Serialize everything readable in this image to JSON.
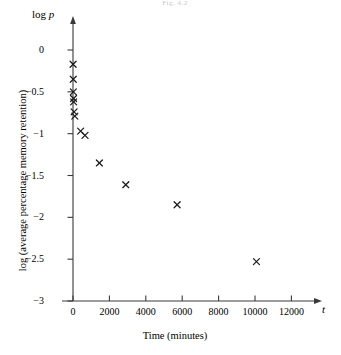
{
  "figure": {
    "caption": "Fig. 4.2"
  },
  "chart_data": {
    "type": "scatter",
    "title": "",
    "xlabel": "Time (minutes)",
    "ylabel": "log (average percentage memory retention)",
    "x_variable_symbol": "t",
    "y_variable_symbol": "log p",
    "xlim": [
      -600,
      13600
    ],
    "ylim": [
      -3,
      0.25
    ],
    "xticks": [
      0,
      2000,
      4000,
      6000,
      8000,
      10000,
      12000
    ],
    "xtick_labels": [
      "0",
      "2000",
      "4000",
      "6000",
      "8000",
      "10000",
      "12000"
    ],
    "yticks": [
      0,
      -0.5,
      -1,
      -1.5,
      -2,
      -2.5,
      -3
    ],
    "ytick_labels": [
      "0",
      "−0.5",
      "−1",
      "−1.5",
      "−2",
      "−2.5",
      "−3"
    ],
    "grid": false,
    "legend": null,
    "marker": "x",
    "marker_color": "#1a1a1a",
    "axis_color": "#3a3a3a",
    "points": [
      {
        "x": 5,
        "y": -0.17
      },
      {
        "x": 15,
        "y": -0.35
      },
      {
        "x": 20,
        "y": -0.5
      },
      {
        "x": 30,
        "y": -0.58
      },
      {
        "x": 35,
        "y": -0.62
      },
      {
        "x": 60,
        "y": -0.74
      },
      {
        "x": 100,
        "y": -0.79
      },
      {
        "x": 420,
        "y": -0.97
      },
      {
        "x": 660,
        "y": -1.02
      },
      {
        "x": 1450,
        "y": -1.35
      },
      {
        "x": 2900,
        "y": -1.61
      },
      {
        "x": 5720,
        "y": -1.85
      },
      {
        "x": 10080,
        "y": -2.53
      }
    ]
  }
}
